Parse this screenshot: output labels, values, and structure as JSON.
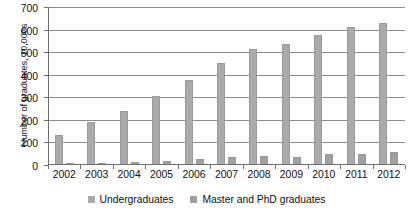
{
  "chart_data": {
    "type": "bar",
    "title": "",
    "subtitle": "",
    "xlabel": "",
    "ylabel": "Number of graduates, 10,000s",
    "categories": [
      "2002",
      "2003",
      "2004",
      "2005",
      "2006",
      "2007",
      "2008",
      "2009",
      "2010",
      "2011",
      "2012"
    ],
    "series": [
      {
        "name": "Undergraduates",
        "color": "#aaaaaa",
        "values": [
          132,
          190,
          240,
          305,
          378,
          450,
          512,
          534,
          578,
          610,
          630
        ]
      },
      {
        "name": "Master and PhD graduates",
        "color": "#a0a0a0",
        "values": [
          9,
          11,
          14,
          18,
          27,
          34,
          38,
          37,
          47,
          49,
          57
        ]
      }
    ],
    "ylim": [
      0,
      700
    ],
    "yticks": [
      0,
      100,
      200,
      300,
      400,
      500,
      600,
      700
    ],
    "ytick_labels": [
      "0",
      "100",
      "200",
      "300",
      "400",
      "500",
      "600",
      "700"
    ],
    "grid": true,
    "grid_axis": "y",
    "legend_position": "bottom"
  }
}
